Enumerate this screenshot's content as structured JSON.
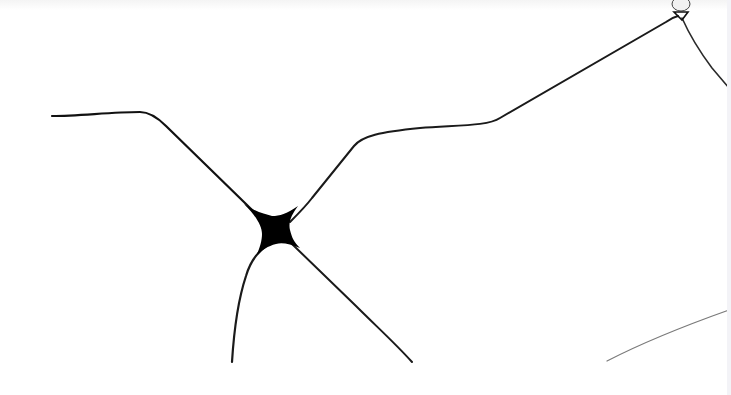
{
  "image": {
    "width": 731,
    "height": 395,
    "background": "#ffffff",
    "edge_strip_color": "#f3f3f7",
    "ink_color": "#111111",
    "faint_ink_color": "#6a6a6a"
  },
  "fibers": [
    {
      "name": "fiber-left-upper",
      "d": "M52,116 C80,116 110,112 140,112 C150,112 158,118 166,126 L246,204 C252,210 258,216 266,222",
      "width": 2.2,
      "color": "#111111"
    },
    {
      "name": "fiber-right-upper",
      "d": "M290,222 C298,214 306,206 312,198 L354,146 C362,136 380,132 420,128 C460,125 488,126 500,118 L666,22 C670,19 674,17 678,16",
      "width": 2,
      "color": "#1a1a1a"
    },
    {
      "name": "fiber-lower-left",
      "d": "M266,246 C258,252 250,262 246,276 C238,300 234,330 232,362",
      "width": 2.2,
      "color": "#1a1a1a"
    },
    {
      "name": "fiber-lower-right",
      "d": "M292,244 L356,306 C376,326 396,344 412,362",
      "width": 2,
      "color": "#1a1a1a"
    },
    {
      "name": "fiber-top-right-branch",
      "d": "M682,18 C690,36 700,52 712,68 L729,88",
      "width": 1.6,
      "color": "#2a2a2a"
    },
    {
      "name": "fiber-bottom-right-faint",
      "d": "M607,361 C640,344 684,326 729,310",
      "width": 1.2,
      "color": "#7a7a7a"
    }
  ],
  "junction": {
    "name": "central-junction-blob",
    "d": "M244,204 C256,212 264,214 272,216 C280,216 286,214 298,206 C292,214 288,222 290,230 C292,238 294,242 300,248 C290,244 282,242 276,244 C268,246 262,250 256,256 C260,248 262,240 262,234 C262,226 256,216 244,204 Z",
    "color": "#000000"
  },
  "droplet": {
    "name": "top-right-droplet",
    "cx": 681,
    "cy": 4,
    "rx": 9,
    "ry": 7,
    "fill": "#f1f1f1",
    "stroke": "#444444",
    "knot": "M674,12 L688,12 L682,20 Z"
  }
}
